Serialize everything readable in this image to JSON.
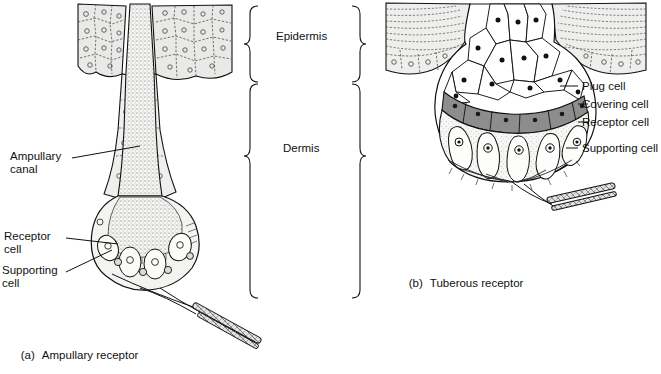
{
  "figure": {
    "kind": "anatomical-diagram",
    "panels": [
      {
        "id": "a",
        "tag": "(a)",
        "caption": "Ampullary receptor",
        "labels": [
          {
            "name": "ampullary-canal",
            "text": "Ampullary\ncanal"
          },
          {
            "name": "receptor-cell",
            "text": "Receptor\ncell"
          },
          {
            "name": "supporting-cell",
            "text": "Supporting\ncell"
          }
        ]
      },
      {
        "id": "b",
        "tag": "(b)",
        "caption": "Tuberous receptor",
        "labels": [
          {
            "name": "plug-cell",
            "text": "Plug cell"
          },
          {
            "name": "covering-cell",
            "text": "Covering cell"
          },
          {
            "name": "receptor-cell",
            "text": "Receptor cell"
          },
          {
            "name": "supporting-cell",
            "text": "Supporting cell"
          }
        ]
      }
    ],
    "layer_brackets": [
      {
        "name": "epidermis",
        "text": "Epidermis"
      },
      {
        "name": "dermis",
        "text": "Dermis"
      }
    ],
    "colors": {
      "ink": "#111111",
      "epidermis_fill": "#e9e9e7",
      "covering_cell_fill": "#8d8d8d",
      "bulb_fill": "#f4f4f2",
      "cell_fill": "#fbfbfa",
      "page_bg": "#ffffff"
    }
  }
}
